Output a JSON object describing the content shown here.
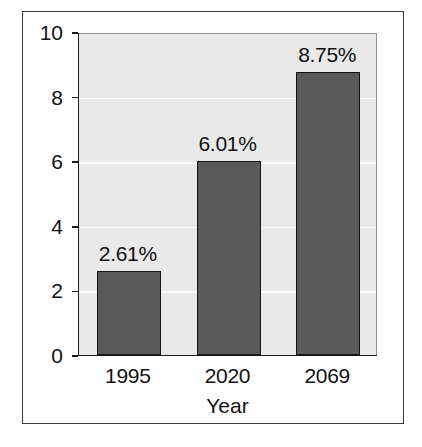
{
  "chart_data": {
    "type": "bar",
    "title": "",
    "subtitle": "",
    "xlabel": "Year",
    "ylabel": "",
    "categories": [
      "1995",
      "2020",
      "2069"
    ],
    "values": [
      2.61,
      6.01,
      8.75
    ],
    "data_labels": [
      "2.61%",
      "6.01%",
      "8.75%"
    ],
    "ylim": [
      0,
      10
    ],
    "yticks": [
      0,
      2,
      4,
      6,
      8,
      10
    ],
    "ytick_labels": [
      "0",
      "2",
      "4",
      "6",
      "8",
      "10"
    ],
    "grid": true,
    "legend": null,
    "series": [
      {
        "name": "",
        "values": [
          2.61,
          6.01,
          8.75
        ]
      }
    ],
    "colors": {
      "bar_fill": "#595959",
      "bar_edge": "#141414",
      "plot_background": "#e9e9e9",
      "gridline": "#fbfbfb",
      "axis": "#1b1b1b",
      "text": "#111111",
      "figure_background": "#ffffff",
      "frame": "#3a3a3a"
    }
  }
}
